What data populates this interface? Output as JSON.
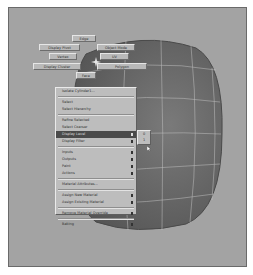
{
  "viewport": {
    "background_color": "#a3a3a3",
    "object_color": "#6e6e6e",
    "wire_color": "#c8c8c8"
  },
  "marking_menu": {
    "north": "Edge",
    "north_west": "Display Pivot",
    "north_east": "Object Mode",
    "west": "Vertex",
    "east": "UV",
    "south_west": "Display Cluster",
    "south_east": "Polygon",
    "south": "Face"
  },
  "context_menu": {
    "items": [
      {
        "label": "Isolate Cylinder1...",
        "submenu": false
      },
      {
        "label": "Select",
        "submenu": false
      },
      {
        "label": "Select Hierarchy",
        "submenu": false
      },
      {
        "label": "Refine Selected",
        "submenu": false
      },
      {
        "label": "Select Coarser",
        "submenu": false
      },
      {
        "label": "Display Level",
        "submenu": true,
        "highlighted": true
      },
      {
        "label": "Display Filter",
        "submenu": true
      },
      {
        "label": "Inputs",
        "submenu": true
      },
      {
        "label": "Outputs",
        "submenu": true
      },
      {
        "label": "Paint",
        "submenu": true
      },
      {
        "label": "Actions",
        "submenu": true
      },
      {
        "label": "Material Attributes...",
        "submenu": false
      },
      {
        "label": "Assign New Material",
        "submenu": true
      },
      {
        "label": "Assign Existing Material",
        "submenu": true
      },
      {
        "label": "Remove Material Override",
        "submenu": true
      },
      {
        "label": "Baking",
        "submenu": true
      }
    ]
  },
  "submenu": {
    "items": [
      "0",
      "1"
    ]
  }
}
